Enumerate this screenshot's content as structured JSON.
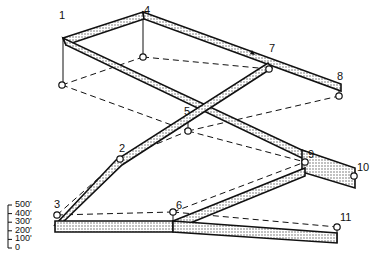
{
  "diagram": {
    "type": "isometric-route-diagram",
    "colors": {
      "line": "#111111",
      "band_fill": "#d8d8d8",
      "background": "#ffffff"
    },
    "points": [
      {
        "id": "p1",
        "label": "1"
      },
      {
        "id": "p2",
        "label": "2"
      },
      {
        "id": "p3",
        "label": "3"
      },
      {
        "id": "p4",
        "label": "4"
      },
      {
        "id": "p5",
        "label": "5"
      },
      {
        "id": "p6",
        "label": "6"
      },
      {
        "id": "p7",
        "label": "7"
      },
      {
        "id": "p8",
        "label": "8"
      },
      {
        "id": "p9",
        "label": "9"
      },
      {
        "id": "p10",
        "label": "10"
      },
      {
        "id": "p11",
        "label": "11"
      }
    ],
    "scale_bar": {
      "ticks": [
        "500'",
        "400'",
        "300'",
        "200'",
        "100'",
        "0"
      ]
    }
  }
}
